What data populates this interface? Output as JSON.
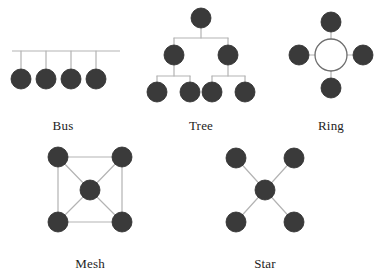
{
  "figure": {
    "width": 385,
    "height": 273,
    "background_color": "#ffffff"
  },
  "style": {
    "node_fill": "#3a3a3a",
    "node_stroke": "#2b2b2b",
    "edge_color": "#b3b3b3",
    "ring_circle_stroke": "#6e6e6e",
    "label_color": "#1d1d1d",
    "node_radius": 10,
    "edge_width": 1.2
  },
  "topologies": [
    {
      "id": "bus",
      "label": "Bus",
      "label_x": 63,
      "label_y": 118,
      "description": "Four nodes attached by drop lines to a single shared backbone line",
      "node_count": 4,
      "backbone": {
        "x1": 12,
        "y1": 51,
        "x2": 120,
        "y2": 51
      },
      "nodes": [
        {
          "id": "bus-n1",
          "cx": 21,
          "cy": 79
        },
        {
          "id": "bus-n2",
          "cx": 46,
          "cy": 79
        },
        {
          "id": "bus-n3",
          "cx": 71,
          "cy": 79
        },
        {
          "id": "bus-n4",
          "cx": 96,
          "cy": 79
        }
      ],
      "edges": [
        {
          "x1": 21,
          "y1": 51,
          "x2": 21,
          "y2": 79
        },
        {
          "x1": 46,
          "y1": 51,
          "x2": 46,
          "y2": 79
        },
        {
          "x1": 71,
          "y1": 51,
          "x2": 71,
          "y2": 79
        },
        {
          "x1": 96,
          "y1": 51,
          "x2": 96,
          "y2": 79
        }
      ]
    },
    {
      "id": "tree",
      "label": "Tree",
      "label_x": 201,
      "label_y": 118,
      "description": "Hierarchical tree: one root, two branch nodes, four leaf nodes",
      "node_count": 7,
      "nodes": [
        {
          "id": "tree-root",
          "cx": 201,
          "cy": 18,
          "level": 1
        },
        {
          "id": "tree-b1",
          "cx": 174,
          "cy": 55,
          "level": 2
        },
        {
          "id": "tree-b2",
          "cx": 228,
          "cy": 55,
          "level": 2
        },
        {
          "id": "tree-l1",
          "cx": 157,
          "cy": 92,
          "level": 3
        },
        {
          "id": "tree-l2",
          "cx": 190,
          "cy": 92,
          "level": 3
        },
        {
          "id": "tree-l3",
          "cx": 212,
          "cy": 92,
          "level": 3
        },
        {
          "id": "tree-l4",
          "cx": 245,
          "cy": 92,
          "level": 3
        }
      ],
      "edges": [
        {
          "x1": 201,
          "y1": 28,
          "x2": 201,
          "y2": 38
        },
        {
          "x1": 174,
          "y1": 38,
          "x2": 228,
          "y2": 38
        },
        {
          "x1": 174,
          "y1": 38,
          "x2": 174,
          "y2": 45
        },
        {
          "x1": 228,
          "y1": 38,
          "x2": 228,
          "y2": 45
        },
        {
          "x1": 174,
          "y1": 65,
          "x2": 174,
          "y2": 76
        },
        {
          "x1": 157,
          "y1": 76,
          "x2": 190,
          "y2": 76
        },
        {
          "x1": 157,
          "y1": 76,
          "x2": 157,
          "y2": 82
        },
        {
          "x1": 190,
          "y1": 76,
          "x2": 190,
          "y2": 82
        },
        {
          "x1": 228,
          "y1": 65,
          "x2": 228,
          "y2": 76
        },
        {
          "x1": 212,
          "y1": 76,
          "x2": 245,
          "y2": 76
        },
        {
          "x1": 212,
          "y1": 76,
          "x2": 212,
          "y2": 82
        },
        {
          "x1": 245,
          "y1": 76,
          "x2": 245,
          "y2": 82
        }
      ]
    },
    {
      "id": "ring",
      "label": "Ring",
      "label_x": 331,
      "label_y": 118,
      "description": "Four nodes attached by spokes to a central hollow ring",
      "node_count": 4,
      "ring_circle": {
        "cx": 331,
        "cy": 55,
        "r": 16
      },
      "nodes": [
        {
          "id": "ring-top",
          "cx": 331,
          "cy": 22
        },
        {
          "id": "ring-left",
          "cx": 299,
          "cy": 55
        },
        {
          "id": "ring-right",
          "cx": 363,
          "cy": 55
        },
        {
          "id": "ring-bottom",
          "cx": 331,
          "cy": 88
        }
      ],
      "edges": [
        {
          "x1": 331,
          "y1": 32,
          "x2": 331,
          "y2": 39
        },
        {
          "x1": 309,
          "y1": 55,
          "x2": 315,
          "y2": 55
        },
        {
          "x1": 347,
          "y1": 55,
          "x2": 353,
          "y2": 55
        },
        {
          "x1": 331,
          "y1": 71,
          "x2": 331,
          "y2": 78
        }
      ]
    },
    {
      "id": "mesh",
      "label": "Mesh",
      "label_x": 90,
      "label_y": 256,
      "description": "Four corner nodes joined in a square plus a central node joined by diagonals",
      "node_count": 5,
      "nodes": [
        {
          "id": "mesh-tl",
          "cx": 58,
          "cy": 157
        },
        {
          "id": "mesh-tr",
          "cx": 122,
          "cy": 157
        },
        {
          "id": "mesh-center",
          "cx": 90,
          "cy": 190
        },
        {
          "id": "mesh-bl",
          "cx": 58,
          "cy": 222
        },
        {
          "id": "mesh-br",
          "cx": 122,
          "cy": 222
        }
      ],
      "edges": [
        {
          "x1": 58,
          "y1": 157,
          "x2": 122,
          "y2": 157
        },
        {
          "x1": 122,
          "y1": 157,
          "x2": 122,
          "y2": 222
        },
        {
          "x1": 122,
          "y1": 222,
          "x2": 58,
          "y2": 222
        },
        {
          "x1": 58,
          "y1": 222,
          "x2": 58,
          "y2": 157
        },
        {
          "x1": 58,
          "y1": 157,
          "x2": 90,
          "y2": 190
        },
        {
          "x1": 122,
          "y1": 157,
          "x2": 90,
          "y2": 190
        },
        {
          "x1": 58,
          "y1": 222,
          "x2": 90,
          "y2": 190
        },
        {
          "x1": 122,
          "y1": 222,
          "x2": 90,
          "y2": 190
        }
      ]
    },
    {
      "id": "star",
      "label": "Star",
      "label_x": 265,
      "label_y": 256,
      "description": "Central hub node connected by four diagonal spokes to outer nodes",
      "node_count": 5,
      "nodes": [
        {
          "id": "star-tl",
          "cx": 236,
          "cy": 158
        },
        {
          "id": "star-tr",
          "cx": 294,
          "cy": 158
        },
        {
          "id": "star-hub",
          "cx": 265,
          "cy": 190
        },
        {
          "id": "star-bl",
          "cx": 236,
          "cy": 222
        },
        {
          "id": "star-br",
          "cx": 294,
          "cy": 222
        }
      ],
      "edges": [
        {
          "x1": 236,
          "y1": 158,
          "x2": 265,
          "y2": 190
        },
        {
          "x1": 294,
          "y1": 158,
          "x2": 265,
          "y2": 190
        },
        {
          "x1": 236,
          "y1": 222,
          "x2": 265,
          "y2": 190
        },
        {
          "x1": 294,
          "y1": 222,
          "x2": 265,
          "y2": 190
        }
      ]
    }
  ]
}
